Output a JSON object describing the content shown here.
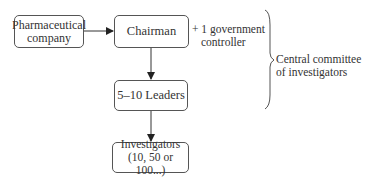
{
  "nodes": {
    "pharma": {
      "line1": "Pharmaceutical",
      "line2": "company"
    },
    "chairman": {
      "label": "Chairman"
    },
    "leaders": {
      "label": "5–10 Leaders"
    },
    "investigators": {
      "line1": "Investigators",
      "line2": "(10, 50 or 100...)"
    }
  },
  "annotations": {
    "controller": {
      "line1": "+ 1 government",
      "line2": "controller"
    },
    "committee": {
      "line1": "Central committee",
      "line2": "of investigators"
    }
  },
  "colors": {
    "stroke": "#333333",
    "text": "#333333",
    "background": "#ffffff"
  }
}
